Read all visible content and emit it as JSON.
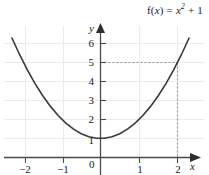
{
  "title": {
    "full": "f(x) = x² + 1",
    "prefix": "f(",
    "var": "x",
    "mid": ") = ",
    "base": "x",
    "exponent": "2",
    "suffix": " + 1"
  },
  "chart_data": {
    "type": "line",
    "xlabel": "x",
    "ylabel": "y",
    "grid": true,
    "legend": "none",
    "xlim": [
      -2.3,
      2.4
    ],
    "ylim": [
      -0.45,
      6.8
    ],
    "xticks": [
      -2,
      -1,
      0,
      1,
      2
    ],
    "xtick_labels": [
      "−2",
      "−1",
      "0",
      "1",
      "2"
    ],
    "yticks": [
      1,
      2,
      3,
      4,
      5,
      6
    ],
    "ytick_labels": [
      "1",
      "2",
      "3",
      "4",
      "5",
      "6"
    ],
    "origin_label": "0",
    "series": [
      {
        "name": "f(x) = x² + 1",
        "equation": "y = x^2 + 1",
        "color": "#3a3a3a",
        "x": [
          -2.3,
          -2.1,
          -1.9,
          -1.7,
          -1.5,
          -1.3,
          -1.1,
          -0.9,
          -0.7,
          -0.5,
          -0.3,
          -0.1,
          0.1,
          0.3,
          0.5,
          0.7,
          0.9,
          1.1,
          1.3,
          1.5,
          1.7,
          1.9,
          2.1,
          2.3
        ],
        "y": [
          6.29,
          5.41,
          4.61,
          3.89,
          3.25,
          2.69,
          2.21,
          1.81,
          1.49,
          1.25,
          1.09,
          1.01,
          1.01,
          1.09,
          1.25,
          1.49,
          1.81,
          2.21,
          2.69,
          3.25,
          3.89,
          4.61,
          5.41,
          6.29
        ]
      }
    ],
    "annotations": [
      {
        "name": "guide-point",
        "x": 2,
        "y": 5,
        "style": "dashed",
        "color": "#8c8c8c",
        "description": "dashed lines from y = 5 across to x = 2 and down to the x-axis"
      }
    ],
    "vertex": {
      "x": 0,
      "y": 1
    }
  },
  "axes": {
    "y_name": "y",
    "x_name": "x"
  },
  "colors": {
    "curve": "#3a3a3a",
    "axis": "#4a4a4a",
    "grid": "#ebebeb",
    "dashed": "#8c8c8c",
    "text": "#1a1a1a"
  }
}
